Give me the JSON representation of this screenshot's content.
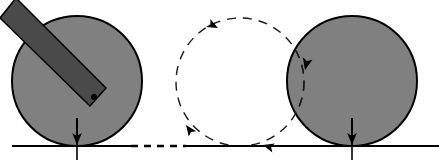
{
  "figure": {
    "type": "mechanics-diagram",
    "canvas": {
      "width": 439,
      "height": 164
    },
    "background_color": "#ffffff"
  },
  "colors": {
    "disk_fill": "#808080",
    "disk_stroke": "#000000",
    "rod_fill": "#4a4a4a",
    "rod_stroke": "#000000",
    "baseline": "#000000",
    "dashed_path": "#1a1a1a",
    "arrow": "#000000",
    "pivot_dot": "#000000"
  },
  "ground": {
    "name": "ground-baseline",
    "y": 146,
    "x_start": 12,
    "x_end": 439,
    "solid_segments": [
      {
        "x1": 12,
        "x2": 131
      },
      {
        "x1": 186,
        "x2": 439
      }
    ],
    "dashed_segment": {
      "x1": 131,
      "x2": 186,
      "dash": "7 6"
    },
    "stroke_width": 2.2
  },
  "disks": [
    {
      "name": "left-disk",
      "label": "initial position",
      "cx": 77,
      "cy": 81,
      "r": 65,
      "fill": "#808080",
      "stroke": "#000000",
      "stroke_width": 2
    },
    {
      "name": "right-disk",
      "label": "final position",
      "cx": 352,
      "cy": 81,
      "r": 65,
      "fill": "#808080",
      "stroke": "#000000",
      "stroke_width": 2
    }
  ],
  "rod": {
    "name": "rod",
    "label": "attached rod",
    "fill": "#4a4a4a",
    "stroke": "#000000",
    "stroke_width": 1.5,
    "points": "0,-14 -16,6 74,94 90,76",
    "pivot": {
      "cx": 78,
      "cy": 85,
      "r": 2.6
    }
  },
  "dashed_circle": {
    "name": "rolling-path-circle",
    "label": "rolling trajectory",
    "cx": 240,
    "cy": 82,
    "r": 64,
    "stroke": "#1a1a1a",
    "stroke_width": 1.4,
    "dash": "9 7"
  },
  "arc_on_right_disk": {
    "name": "rolling-path-arc-overlap",
    "stroke": "#1a1a1a",
    "stroke_width": 1.4,
    "dash": "9 7"
  },
  "arrowheads": [
    {
      "name": "arrowhead-top",
      "x": 218,
      "y": 28,
      "rotation": 27,
      "direction": "clockwise-top"
    },
    {
      "name": "arrowhead-left",
      "x": 186,
      "y": 125,
      "rotation": -126,
      "direction": "counterclockwise-lower-left"
    },
    {
      "name": "arrowhead-bottom",
      "x": 263,
      "y": 145,
      "rotation": 196,
      "direction": "leftward-on-baseline"
    },
    {
      "name": "arrowhead-right-disk",
      "x": 305,
      "y": 70,
      "rotation": 103,
      "direction": "downward-into-right-disk"
    }
  ],
  "contact_markers": [
    {
      "name": "contact-marker-left",
      "x": 77,
      "arrow_y_top": 118,
      "arrow_y_tip": 143,
      "tick_y_top": 136,
      "tick_y_bottom": 160,
      "label": "initial contact point"
    },
    {
      "name": "contact-marker-right",
      "x": 352,
      "arrow_y_top": 118,
      "arrow_y_tip": 143,
      "tick_y_top": 136,
      "tick_y_bottom": 160,
      "label": "final contact point"
    }
  ]
}
